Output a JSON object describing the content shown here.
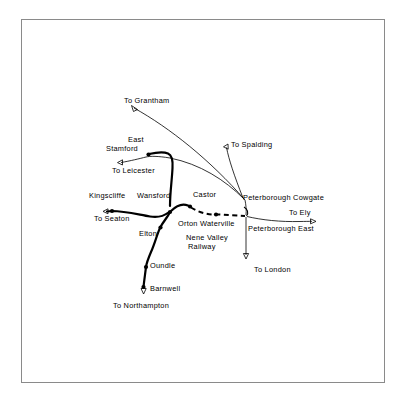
{
  "figure": {
    "type": "schematic-map",
    "background_color": "#ffffff",
    "line_color": "#000000",
    "frame_color": "#8a8a8a"
  },
  "labels": {
    "to_grantham": "To Grantham",
    "to_spalding": "To Spalding",
    "east": "East",
    "stamford": "Stamford",
    "to_leicester": "To Leicester",
    "kingscliffe": "Kingscliffe",
    "wansford": "Wansford",
    "castor": "Castor",
    "peterborough_cowgate": "Peterborough Cowgate",
    "to_ely": "To Ely",
    "to_seaton": "To Seaton",
    "orton_waterville": "Orton Waterville",
    "peterborough_east": "Peterborough East",
    "elton": "Elton",
    "nene_valley": "Nene Valley",
    "railway": "Railway",
    "oundle": "Oundle",
    "to_london": "To London",
    "barnwell": "Barnwell",
    "to_northampton": "To Northampton"
  },
  "map_data": {
    "stations": [
      {
        "name": "East Stamford",
        "x": 148,
        "y": 155,
        "marker": "dot"
      },
      {
        "name": "Kingscliffe",
        "x": 112,
        "y": 211,
        "marker": "dot"
      },
      {
        "name": "Wansford",
        "x": 170,
        "y": 212,
        "marker": "dot"
      },
      {
        "name": "Castor",
        "x": 190,
        "y": 208,
        "marker": "dot"
      },
      {
        "name": "Orton Waterville",
        "x": 216,
        "y": 214,
        "marker": "dot"
      },
      {
        "name": "Peterborough East",
        "x": 246,
        "y": 216,
        "marker": "junction"
      },
      {
        "name": "Elton",
        "x": 159,
        "y": 228,
        "marker": "dot"
      },
      {
        "name": "Oundle",
        "x": 146,
        "y": 267,
        "marker": "dot"
      },
      {
        "name": "Barnwell",
        "x": 143,
        "y": 288,
        "marker": "dot"
      }
    ],
    "terminals": [
      {
        "name": "To Grantham",
        "x": 133,
        "y": 105,
        "arrow": "up-left"
      },
      {
        "name": "To Spalding",
        "x": 226,
        "y": 146,
        "arrow": "left"
      },
      {
        "name": "To Leicester",
        "x": 119,
        "y": 164,
        "arrow": "left"
      },
      {
        "name": "To Seaton",
        "x": 104,
        "y": 212,
        "arrow": "left"
      },
      {
        "name": "To Ely",
        "x": 319,
        "y": 219,
        "arrow": "right"
      },
      {
        "name": "To London",
        "x": 287,
        "y": 258,
        "arrow": "down"
      },
      {
        "name": "To Northampton",
        "x": 143,
        "y": 292,
        "arrow": "down"
      }
    ],
    "lines": [
      {
        "name": "nene-valley-railway",
        "style": "dashed",
        "from": "Wansford",
        "to": "Peterborough East"
      },
      {
        "name": "main-line-north",
        "style": "solid-thick",
        "from": "Stamford",
        "to": "Wansford"
      },
      {
        "name": "branch-south",
        "style": "solid-thick",
        "from": "Wansford",
        "to": "Barnwell"
      },
      {
        "name": "seaton-line",
        "style": "solid-thick",
        "from": "To Seaton",
        "to": "Wansford"
      },
      {
        "name": "grantham-line",
        "style": "solid-thin",
        "from": "To Grantham",
        "to": "Peterborough Cowgate"
      },
      {
        "name": "spalding-line",
        "style": "solid-thin",
        "from": "To Spalding",
        "to": "Peterborough Cowgate"
      },
      {
        "name": "ely-line",
        "style": "solid-thin",
        "from": "Peterborough East",
        "to": "To Ely"
      },
      {
        "name": "london-line",
        "style": "solid-thin",
        "from": "Peterborough East",
        "to": "To London"
      }
    ]
  }
}
